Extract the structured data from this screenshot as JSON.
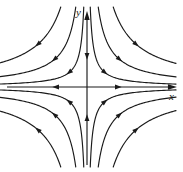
{
  "figure": {
    "kind": "phase-portrait",
    "background_color": "#ffffff",
    "line_color": "#1a1a1a",
    "width": 183,
    "height": 172
  },
  "axes": {
    "x_label": "x",
    "y_label": "y",
    "origin": {
      "x": 87,
      "y": 87
    },
    "x_axis": {
      "start_x": 7,
      "end_x": 176,
      "y": 87,
      "arrow_at": "right"
    },
    "y_axis": {
      "start_y": 165,
      "end_y": 12,
      "x": 87,
      "arrow_at": "top"
    }
  },
  "chart_data": {
    "type": "line",
    "title": "",
    "xlabel": "x",
    "ylabel": "y",
    "equilibrium": {
      "x": 0,
      "y": 0,
      "kind": "saddle"
    },
    "stable_manifold": "y-axis",
    "unstable_manifold": "x-axis",
    "grid": false,
    "legend": false,
    "xlim": [
      -80,
      89
    ],
    "ylim": [
      -78,
      75
    ],
    "separatrix_arrows": [
      {
        "on": "y-axis",
        "at": {
          "x": 0,
          "y": 31
        },
        "direction": "down"
      },
      {
        "on": "y-axis",
        "at": {
          "x": 0,
          "y": -31
        },
        "direction": "up"
      },
      {
        "on": "x-axis",
        "at": {
          "x": -31,
          "y": 0
        },
        "direction": "left"
      },
      {
        "on": "x-axis",
        "at": {
          "x": 31,
          "y": 0
        },
        "direction": "right"
      }
    ],
    "series": [
      {
        "name": "Q1 inner",
        "quadrant": "I",
        "k": 260,
        "arrow_at_t": 0.5
      },
      {
        "name": "Q1 middle",
        "quadrant": "I",
        "k": 900,
        "arrow_at_t": 0.5
      },
      {
        "name": "Q1 outer",
        "quadrant": "I",
        "k": 2100,
        "arrow_at_t": 0.5
      },
      {
        "name": "Q2 inner",
        "quadrant": "II",
        "k": 260,
        "arrow_at_t": 0.5
      },
      {
        "name": "Q2 middle",
        "quadrant": "II",
        "k": 900,
        "arrow_at_t": 0.5
      },
      {
        "name": "Q2 outer",
        "quadrant": "II",
        "k": 2100,
        "arrow_at_t": 0.5
      },
      {
        "name": "Q3 inner",
        "quadrant": "III",
        "k": 260,
        "arrow_at_t": 0.5
      },
      {
        "name": "Q3 middle",
        "quadrant": "III",
        "k": 900,
        "arrow_at_t": 0.5
      },
      {
        "name": "Q3 outer",
        "quadrant": "III",
        "k": 2100,
        "arrow_at_t": 0.5
      },
      {
        "name": "Q4 inner",
        "quadrant": "IV",
        "k": 260,
        "arrow_at_t": 0.5
      },
      {
        "name": "Q4 middle",
        "quadrant": "IV",
        "k": 900,
        "arrow_at_t": 0.5
      },
      {
        "name": "Q4 outer",
        "quadrant": "IV",
        "k": 2100,
        "arrow_at_t": 0.5
      }
    ]
  }
}
